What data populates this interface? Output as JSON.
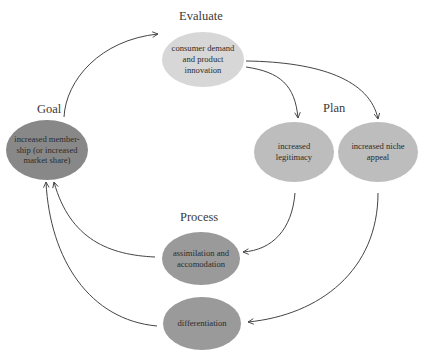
{
  "diagram": {
    "stages": {
      "evaluate": "Evaluate",
      "goal": "Goal",
      "plan": "Plan",
      "process": "Process"
    },
    "nodes": {
      "consumer_demand": "consumer demand and product innovation",
      "membership": "increased member-ship (or increased market share)",
      "legitimacy": "increased legitimacy",
      "niche_appeal": "increased niche appeal",
      "assimilation": "assimilation and accomodation",
      "differentiation": "differentiation"
    },
    "colors": {
      "evaluate_node": "#d7d7d7",
      "plan_nodes": "#bdbdbd",
      "process_nodes": "#9a9a9a",
      "goal_node": "#888888",
      "arrows": "#444444"
    },
    "edges": [
      {
        "from": "membership",
        "to": "consumer_demand"
      },
      {
        "from": "consumer_demand",
        "to": "legitimacy"
      },
      {
        "from": "consumer_demand",
        "to": "niche_appeal"
      },
      {
        "from": "legitimacy",
        "to": "assimilation"
      },
      {
        "from": "niche_appeal",
        "to": "differentiation"
      },
      {
        "from": "assimilation",
        "to": "membership"
      },
      {
        "from": "differentiation",
        "to": "membership"
      }
    ]
  }
}
